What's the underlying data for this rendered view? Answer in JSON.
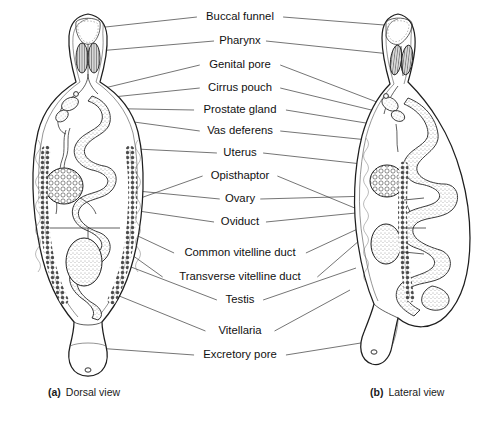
{
  "figure": {
    "background": "#ffffff",
    "ink": "#1e1e1e",
    "width": 491,
    "height": 427
  },
  "labels": [
    {
      "id": "buccal-funnel",
      "text": "Buccal funnel",
      "x": 240,
      "y": 17,
      "left_end": [
        78,
        30
      ],
      "right_end": [
        397,
        26
      ]
    },
    {
      "id": "pharynx",
      "text": "Pharynx",
      "x": 240,
      "y": 41,
      "left_end": [
        86,
        52
      ],
      "right_end": [
        400,
        55
      ]
    },
    {
      "id": "genital-pore",
      "text": "Genital pore",
      "x": 240,
      "y": 65,
      "left_end": [
        88,
        92
      ],
      "right_end": [
        382,
        104
      ]
    },
    {
      "id": "cirrus-pouch",
      "text": "Cirrus pouch",
      "x": 240,
      "y": 88,
      "left_end": [
        84,
        100
      ],
      "right_end": [
        388,
        114
      ]
    },
    {
      "id": "prostate-gland",
      "text": "Prostate gland",
      "x": 240,
      "y": 110,
      "left_end": [
        80,
        108
      ],
      "right_end": [
        372,
        124
      ]
    },
    {
      "id": "vas-deferens",
      "text": "Vas deferens",
      "x": 240,
      "y": 131,
      "left_end": [
        90,
        116
      ],
      "right_end": [
        368,
        140
      ]
    },
    {
      "id": "uterus",
      "text": "Uterus",
      "x": 240,
      "y": 153,
      "left_end": [
        96,
        147
      ],
      "right_end": [
        380,
        166
      ]
    },
    {
      "id": "opisthaptor",
      "text": "Opisthaptor",
      "x": 240,
      "y": 176,
      "left_end": [
        118,
        206
      ],
      "right_end": [
        449,
        247
      ]
    },
    {
      "id": "ovary",
      "text": "Ovary",
      "x": 240,
      "y": 199,
      "left_end": [
        86,
        186
      ],
      "right_end": [
        372,
        196
      ]
    },
    {
      "id": "oviduct",
      "text": "Oviduct",
      "x": 240,
      "y": 222,
      "left_end": [
        104,
        206
      ],
      "right_end": [
        366,
        212
      ]
    },
    {
      "id": "common-vitelline-duct",
      "text": "Common vitelline duct",
      "x": 240,
      "y": 253,
      "left_end": [
        108,
        222
      ],
      "right_end": [
        364,
        226
      ]
    },
    {
      "id": "transverse-vitelline-duct",
      "text": "Transverse vitelline duct",
      "x": 240,
      "y": 277,
      "left_end": [
        100,
        232
      ],
      "right_end": [
        360,
        240
      ]
    },
    {
      "id": "testis",
      "text": "Testis",
      "x": 240,
      "y": 300,
      "left_end": [
        92,
        252
      ],
      "right_end": [
        356,
        268
      ]
    },
    {
      "id": "vitellaria",
      "text": "Vitellaria",
      "x": 240,
      "y": 331,
      "left_end": [
        70,
        276
      ],
      "right_end": [
        350,
        290
      ]
    },
    {
      "id": "excretory-pore",
      "text": "Excretory pore",
      "x": 240,
      "y": 355,
      "left_end": [
        96,
        348
      ],
      "right_end": [
        392,
        338
      ]
    }
  ],
  "captions": [
    {
      "id": "caption-a",
      "letter": "(a)",
      "text": "Dorsal view",
      "x": 48,
      "y": 396
    },
    {
      "id": "caption-b",
      "letter": "(b)",
      "text": "Lateral view",
      "x": 370,
      "y": 396
    }
  ]
}
